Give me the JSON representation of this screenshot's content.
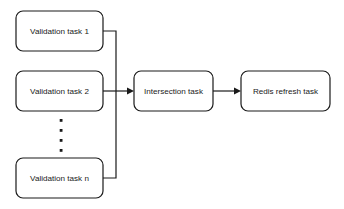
{
  "diagram": {
    "background_color": "#ffffff",
    "stroke_color": "#1a1a1a",
    "nodes": [
      {
        "id": "validation-task-1",
        "label": "Validation task 1",
        "x": 16,
        "y": 11,
        "width": 87,
        "height": 40,
        "shape": "rounded-rectangle"
      },
      {
        "id": "validation-task-2",
        "label": "Validation task 2",
        "x": 16,
        "y": 71,
        "width": 87,
        "height": 40,
        "shape": "rounded-rectangle"
      },
      {
        "id": "validation-task-n",
        "label": "Validation task n",
        "x": 16,
        "y": 158,
        "width": 87,
        "height": 40,
        "shape": "rounded-rectangle"
      },
      {
        "id": "intersection-task",
        "label": "Intersection task",
        "x": 134,
        "y": 71,
        "width": 79,
        "height": 40,
        "shape": "rounded-rectangle"
      },
      {
        "id": "redis-refresh-task",
        "label": "Redis refresh task",
        "x": 241,
        "y": 71,
        "width": 89,
        "height": 40,
        "shape": "rounded-rectangle"
      }
    ],
    "ellipsis": {
      "name": "vertical-ellipsis",
      "meaning": "additional validation tasks omitted",
      "dot_count": 4,
      "x": 61,
      "y_start": 119,
      "dot_size": 2.6,
      "dot_spacing": 10
    },
    "connectors": [
      {
        "id": "task1-to-bus",
        "from": "validation-task-1",
        "to": "intersection-task",
        "path": "M 103 31 L 116 31 L 116 91",
        "arrow": false
      },
      {
        "id": "task2-to-intersection",
        "from": "validation-task-2",
        "to": "intersection-task",
        "path": "M 103 91 L 131 91",
        "arrow": true
      },
      {
        "id": "taskn-to-bus",
        "from": "validation-task-n",
        "to": "intersection-task",
        "path": "M 103 178 L 116 178 L 116 91",
        "arrow": false
      },
      {
        "id": "intersection-to-redis",
        "from": "intersection-task",
        "to": "redis-refresh-task",
        "path": "M 213 91 L 238 91",
        "arrow": true
      }
    ]
  }
}
